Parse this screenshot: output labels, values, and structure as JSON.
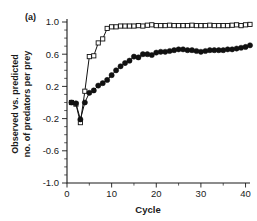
{
  "figure": {
    "panel_label": "(a)",
    "background": "#ffffff",
    "ink": "#111111"
  },
  "chart_data": {
    "type": "line",
    "title": "",
    "subtitle": "",
    "panel": "(a)",
    "xlabel": "Cycle",
    "ylabel": "Observed vs. predicted no. of predators per prey",
    "ylabel_line1": "Observed vs. predicted",
    "ylabel_line2": "no. of predators per prey",
    "xlim": [
      0,
      41
    ],
    "ylim": [
      -1.0,
      1.0
    ],
    "xticks": [
      0,
      10,
      20,
      30,
      40
    ],
    "xticklabels": [
      "0",
      "10",
      "20",
      "30",
      "40"
    ],
    "xtick_minor_step": 5,
    "yticks": [
      -1.0,
      -0.6,
      -0.2,
      0.2,
      0.6,
      1.0
    ],
    "yticklabels": [
      "-1.0",
      "-0.6",
      "-0.2",
      "0.2",
      "0.6",
      "1.0"
    ],
    "ytick_minor_step": 0.1,
    "grid": false,
    "legend": null,
    "legend_position": "none",
    "spines": [
      "left",
      "bottom"
    ],
    "x": [
      1,
      2,
      3,
      4,
      5,
      6,
      7,
      8,
      9,
      10,
      11,
      12,
      13,
      14,
      15,
      16,
      17,
      18,
      19,
      20,
      21,
      22,
      23,
      24,
      25,
      26,
      27,
      28,
      29,
      30,
      31,
      32,
      33,
      34,
      35,
      36,
      37,
      38,
      39,
      40,
      41
    ],
    "series": [
      {
        "name": "open-squares",
        "marker": "square-open",
        "marker_size": 4.2,
        "color": "#111111",
        "fill": "#ffffff",
        "values": [
          0.0,
          -0.02,
          -0.25,
          0.14,
          0.57,
          0.58,
          0.74,
          0.79,
          0.92,
          0.94,
          0.94,
          0.95,
          0.95,
          0.95,
          0.95,
          0.955,
          0.95,
          0.96,
          0.965,
          0.955,
          0.955,
          0.955,
          0.96,
          0.955,
          0.955,
          0.955,
          0.955,
          0.96,
          0.955,
          0.955,
          0.955,
          0.96,
          0.955,
          0.955,
          0.955,
          0.955,
          0.96,
          0.965,
          0.955,
          0.965,
          0.97
        ]
      },
      {
        "name": "filled-circles",
        "marker": "circle-filled",
        "marker_size": 2.6,
        "color": "#111111",
        "fill": "#111111",
        "values": [
          0.0,
          -0.01,
          -0.21,
          0.0,
          0.12,
          0.15,
          0.21,
          0.24,
          0.28,
          0.34,
          0.4,
          0.45,
          0.49,
          0.52,
          0.57,
          0.56,
          0.6,
          0.6,
          0.59,
          0.62,
          0.63,
          0.63,
          0.64,
          0.65,
          0.66,
          0.66,
          0.65,
          0.65,
          0.64,
          0.63,
          0.64,
          0.65,
          0.65,
          0.65,
          0.65,
          0.66,
          0.66,
          0.67,
          0.68,
          0.69,
          0.71
        ]
      }
    ]
  }
}
